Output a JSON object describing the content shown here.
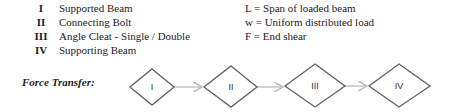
{
  "legend": {
    "items": [
      {
        "numeral": "I",
        "label": "Supported Beam"
      },
      {
        "numeral": "II",
        "label": "Connecting Bolt"
      },
      {
        "numeral": "III",
        "label": "Angle Cleat - Single / Double"
      },
      {
        "numeral": "IV",
        "label": "Supporting Beam"
      }
    ],
    "definitions": [
      "L = Span of loaded beam",
      "w = Uniform distributed load",
      "F = End shear"
    ]
  },
  "force_transfer": {
    "title": "Force Transfer:",
    "nodes": [
      {
        "label": "I"
      },
      {
        "label": "II"
      },
      {
        "label": "III"
      },
      {
        "label": "IV"
      }
    ],
    "colors": {
      "diamond_stroke": "#666666",
      "arrow": "#bbbbbb"
    }
  }
}
